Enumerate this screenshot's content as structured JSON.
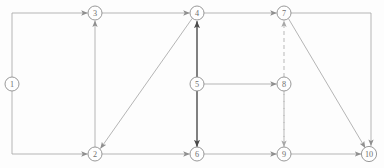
{
  "diagram": {
    "width": 384,
    "height": 168,
    "background_color": "#fdfdfd",
    "node_radius": 7,
    "colors": {
      "thin_edge": "#a8a8a8",
      "bold_edge": "#565656",
      "dashed_edge": "#b4b4b4",
      "node_stroke": "#8d8d8d",
      "node_fill": "#fefefe",
      "label": "#6f6f6f"
    },
    "nodes": [
      {
        "id": "1",
        "label": "1",
        "x": 12,
        "y": 84
      },
      {
        "id": "2",
        "label": "2",
        "x": 95,
        "y": 154
      },
      {
        "id": "3",
        "label": "3",
        "x": 95,
        "y": 13
      },
      {
        "id": "4",
        "label": "4",
        "x": 197,
        "y": 13
      },
      {
        "id": "5",
        "label": "5",
        "x": 197,
        "y": 84
      },
      {
        "id": "6",
        "label": "6",
        "x": 197,
        "y": 154
      },
      {
        "id": "7",
        "label": "7",
        "x": 284,
        "y": 13
      },
      {
        "id": "8",
        "label": "8",
        "x": 284,
        "y": 84
      },
      {
        "id": "9",
        "label": "9",
        "x": 284,
        "y": 154
      },
      {
        "id": "10",
        "label": "10",
        "x": 369,
        "y": 154
      }
    ],
    "edges": [
      {
        "id": "e1-3",
        "from": "1",
        "to": "3",
        "style": "thin",
        "routing": "orthogonal-up"
      },
      {
        "id": "e1-2",
        "from": "1",
        "to": "2",
        "style": "thin",
        "routing": "orthogonal-down"
      },
      {
        "id": "e3-4",
        "from": "3",
        "to": "4",
        "style": "thin",
        "routing": "straight"
      },
      {
        "id": "e4-7",
        "from": "4",
        "to": "7",
        "style": "thin",
        "routing": "straight"
      },
      {
        "id": "e2-3",
        "from": "2",
        "to": "3",
        "style": "thin",
        "routing": "straight"
      },
      {
        "id": "e4-2",
        "from": "4",
        "to": "2",
        "style": "thin",
        "routing": "diagonal"
      },
      {
        "id": "e5-4",
        "from": "5",
        "to": "4",
        "style": "bold",
        "routing": "straight"
      },
      {
        "id": "e5-6",
        "from": "5",
        "to": "6",
        "style": "bold",
        "routing": "straight"
      },
      {
        "id": "e5-8",
        "from": "5",
        "to": "8",
        "style": "thin",
        "routing": "straight"
      },
      {
        "id": "e9-7",
        "from": "9",
        "to": "7",
        "style": "dashed",
        "routing": "straight-through-8"
      },
      {
        "id": "e7-9",
        "from": "7",
        "to": "9",
        "style": "dashed",
        "routing": "straight-through-8"
      },
      {
        "id": "e2-6",
        "from": "2",
        "to": "6",
        "style": "thin",
        "routing": "straight"
      },
      {
        "id": "e6-9",
        "from": "6",
        "to": "9",
        "style": "thin",
        "routing": "straight"
      },
      {
        "id": "e9-10",
        "from": "9",
        "to": "10",
        "style": "thin",
        "routing": "straight"
      },
      {
        "id": "e7-10d",
        "from": "7",
        "to": "10",
        "style": "thin",
        "routing": "diagonal"
      },
      {
        "id": "e7-10o",
        "from": "7",
        "to": "10",
        "style": "thin",
        "routing": "orthogonal-right-down"
      }
    ]
  }
}
